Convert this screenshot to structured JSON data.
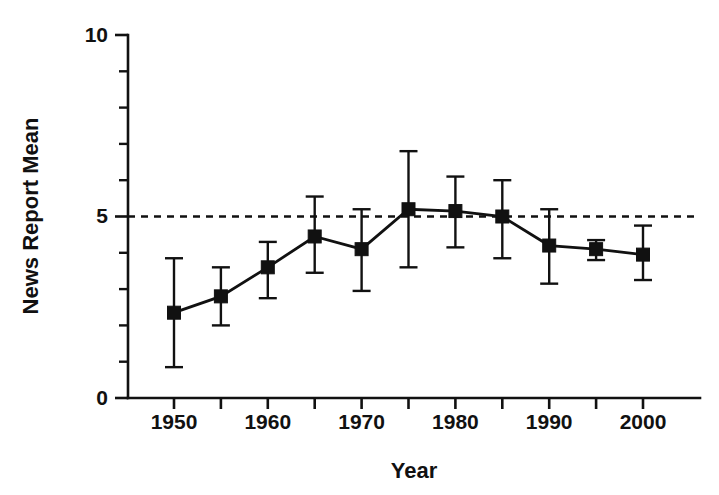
{
  "chart_data": {
    "type": "line",
    "title": "",
    "subtitle": "",
    "xlabel": "Year",
    "ylabel": "News Report Mean",
    "x": [
      1950,
      1955,
      1960,
      1965,
      1970,
      1975,
      1980,
      1985,
      1990,
      1995,
      2000
    ],
    "values": [
      2.35,
      2.8,
      3.6,
      4.45,
      4.1,
      5.2,
      5.15,
      5.0,
      4.2,
      4.1,
      3.95
    ],
    "error_upper": [
      3.85,
      3.6,
      4.3,
      5.55,
      5.2,
      6.8,
      6.1,
      6.0,
      5.2,
      4.35,
      4.75
    ],
    "error_lower": [
      0.85,
      2.0,
      2.75,
      3.45,
      2.95,
      3.6,
      4.15,
      3.85,
      3.15,
      3.8,
      3.25
    ],
    "series": [
      {
        "name": "News Report Mean",
        "values": [
          2.35,
          2.8,
          3.6,
          4.45,
          4.1,
          5.2,
          5.15,
          5.0,
          4.2,
          4.1,
          3.95
        ]
      }
    ],
    "xlim": [
      1946,
      2004
    ],
    "ylim": [
      0,
      10
    ],
    "x_ticks": [
      1950,
      1955,
      1960,
      1965,
      1970,
      1975,
      1980,
      1985,
      1990,
      1995,
      2000
    ],
    "x_tick_labels": [
      "1950",
      "",
      "1960",
      "",
      "1970",
      "",
      "1980",
      "",
      "1990",
      "",
      "2000"
    ],
    "x_tick_labels_shown": [
      "1950",
      "1960",
      "1970",
      "1980",
      "1990",
      "2000"
    ],
    "y_ticks": [
      0,
      1,
      2,
      3,
      4,
      5,
      6,
      7,
      8,
      9,
      10
    ],
    "y_tick_labels": [
      "0",
      "",
      "",
      "",
      "",
      "5",
      "",
      "",
      "",
      "",
      "10"
    ],
    "y_tick_labels_shown": [
      "0",
      "5",
      "10"
    ],
    "y_major_ticks": [
      0,
      5,
      10
    ],
    "grid": false,
    "legend": false,
    "legend_position": "none",
    "annotations": [
      {
        "name": "reference-line",
        "type": "hline",
        "y": 5,
        "style": "dashed",
        "label": ""
      }
    ],
    "marker_style": "filled-square",
    "error_bar_style": "capped",
    "colors": {
      "series": "#111111",
      "axis": "#111111",
      "background": "#ffffff",
      "reference_line": "#111111"
    }
  },
  "axes": {
    "y_title": "News Report Mean",
    "x_title": "Year"
  }
}
